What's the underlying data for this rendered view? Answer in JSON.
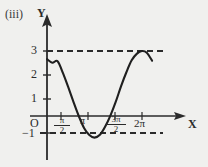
{
  "figure": {
    "label": "(iii)",
    "background_color": "#f0f0ee",
    "ink_color": "#2b2b2b"
  },
  "axes": {
    "y_label": "Y",
    "x_label": "X",
    "origin_label": "O"
  },
  "chart_data": {
    "type": "line",
    "title": "(iii)",
    "xlabel": "X",
    "ylabel": "Y",
    "xlim": [
      0,
      7.6
    ],
    "ylim": [
      -1.6,
      3.6
    ],
    "grid": false,
    "legend": null,
    "x_tick_labels": [
      "O",
      "π/2",
      "π",
      "3π/2",
      "2π"
    ],
    "x_tick_values": [
      0,
      1.5708,
      3.1416,
      4.7124,
      6.2832
    ],
    "x_tick_numerators": [
      "",
      "π",
      "π",
      "3π",
      "2π"
    ],
    "x_tick_denominators": [
      "",
      "2",
      "",
      "2",
      ""
    ],
    "y_tick_labels": [
      "3",
      "2",
      "1",
      "−1"
    ],
    "y_tick_values": [
      3,
      2,
      1,
      -1
    ],
    "annotations": [
      {
        "kind": "dashed-horizontal",
        "y": 3,
        "x_from": 0,
        "x_to": 7.1,
        "label": "3"
      },
      {
        "kind": "dashed-horizontal",
        "y": -1,
        "x_from": -0.1,
        "x_to": 7.1,
        "label": "−1"
      }
    ],
    "series": [
      {
        "name": "y = 1 + 2 cos x",
        "equation": "y = 1 + 2cos(x)",
        "amplitude": 2,
        "vertical_shift": 1,
        "period": 6.2832,
        "maximum": 3,
        "minimum": -1,
        "x_start": 0.0,
        "x_end": 6.95,
        "x": [
          0.0,
          0.35,
          0.7,
          1.05,
          1.4,
          1.75,
          2.1,
          2.45,
          2.8,
          3.14,
          3.5,
          3.85,
          4.2,
          4.55,
          4.9,
          5.25,
          5.6,
          5.95,
          6.28,
          6.6,
          6.95
        ],
        "y": [
          2.62,
          2.46,
          2.53,
          1.99,
          1.34,
          0.65,
          0.0,
          -0.55,
          -0.88,
          -1.0,
          -0.87,
          -0.49,
          0.03,
          0.66,
          1.38,
          2.02,
          2.57,
          2.88,
          3.0,
          2.92,
          2.55
        ]
      }
    ]
  }
}
